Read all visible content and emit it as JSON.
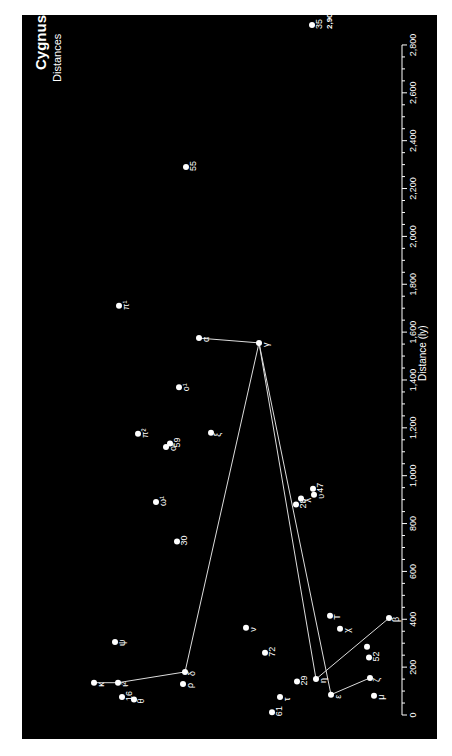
{
  "chart_data": {
    "type": "scatter",
    "title": "Cygnus",
    "subtitle": "Distances",
    "xlabel": "Distance (ly)",
    "axis": {
      "range": [
        0,
        2800
      ],
      "ticks": [
        0,
        200,
        400,
        600,
        800,
        1000,
        1200,
        1400,
        1600,
        1800,
        2000,
        2200,
        2400,
        2600,
        2800
      ],
      "tick_labels": [
        "0",
        "200",
        "400",
        "600",
        "800",
        "1,000",
        "1,200",
        "1,400",
        "1,600",
        "1,800",
        "2,000",
        "2,200",
        "2,400",
        "2,600",
        "2,800"
      ],
      "grid": false
    },
    "orientation": "rotated-90 (distance axis vertical, increasing upward; text reads bottom-to-top)",
    "stars": [
      {
        "name": "35",
        "distance": 2900,
        "lateral": 312,
        "note": "2,900 ly"
      },
      {
        "name": "55",
        "distance": 2290,
        "lateral": 186
      },
      {
        "name": "π¹",
        "distance": 1710,
        "lateral": 119
      },
      {
        "name": "α",
        "distance": 1575,
        "lateral": 199
      },
      {
        "name": "γ",
        "distance": 1555,
        "lateral": 259
      },
      {
        "name": "o¹",
        "distance": 1370,
        "lateral": 179
      },
      {
        "name": "π²",
        "distance": 1175,
        "lateral": 138
      },
      {
        "name": "ξ",
        "distance": 1180,
        "lateral": 211
      },
      {
        "name": "59",
        "distance": 1135,
        "lateral": 170
      },
      {
        "name": "o²",
        "distance": 1120,
        "lateral": 166
      },
      {
        "name": "ω¹",
        "distance": 890,
        "lateral": 156
      },
      {
        "name": "30",
        "distance": 725,
        "lateral": 177
      },
      {
        "name": "47",
        "distance": 945,
        "lateral": 313
      },
      {
        "name": "υ",
        "distance": 920,
        "lateral": 314
      },
      {
        "name": "λ",
        "distance": 905,
        "lateral": 301
      },
      {
        "name": "28",
        "distance": 880,
        "lateral": 296
      },
      {
        "name": "T",
        "distance": 415,
        "lateral": 330
      },
      {
        "name": "β",
        "distance": 405,
        "lateral": 389
      },
      {
        "name": "ν",
        "distance": 365,
        "lateral": 246
      },
      {
        "name": "χ",
        "distance": 360,
        "lateral": 340
      },
      {
        "name": "ψ",
        "distance": 305,
        "lateral": 115
      },
      {
        "name": "",
        "distance": 285,
        "lateral": 367
      },
      {
        "name": "72",
        "distance": 260,
        "lateral": 265
      },
      {
        "name": "52",
        "distance": 240,
        "lateral": 369
      },
      {
        "name": "δ",
        "distance": 180,
        "lateral": 185
      },
      {
        "name": "ζ",
        "distance": 155,
        "lateral": 370
      },
      {
        "name": "η",
        "distance": 150,
        "lateral": 316
      },
      {
        "name": "29",
        "distance": 140,
        "lateral": 297
      },
      {
        "name": "κ",
        "distance": 135,
        "lateral": 94
      },
      {
        "name": "ι²",
        "distance": 135,
        "lateral": 118
      },
      {
        "name": "ρ",
        "distance": 130,
        "lateral": 183
      },
      {
        "name": "ε",
        "distance": 85,
        "lateral": 331
      },
      {
        "name": "μ",
        "distance": 80,
        "lateral": 374
      },
      {
        "name": "16",
        "distance": 75,
        "lateral": 122
      },
      {
        "name": "τ",
        "distance": 75,
        "lateral": 280
      },
      {
        "name": "θ",
        "distance": 65,
        "lateral": 134
      },
      {
        "name": "61",
        "distance": 12,
        "lateral": 272
      }
    ],
    "lines": [
      [
        "κ",
        "ι²"
      ],
      [
        "ι²",
        "δ"
      ],
      [
        "δ",
        "γ"
      ],
      [
        "γ",
        "α"
      ],
      [
        "γ",
        "η"
      ],
      [
        "γ",
        "ε"
      ],
      [
        "η",
        "β"
      ],
      [
        "ε",
        "ζ"
      ]
    ],
    "colors": {
      "background": "#000000",
      "page": "#ffffff",
      "foreground": "#ffffff",
      "lines": "#dddddd"
    }
  }
}
